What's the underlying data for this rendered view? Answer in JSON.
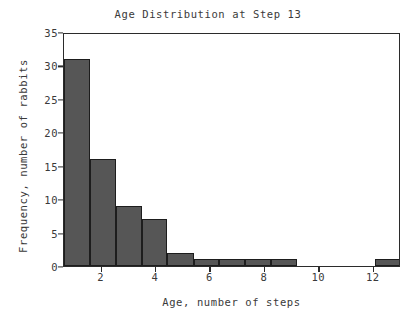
{
  "chart_data": {
    "type": "bar",
    "title": "Age Distribution at Step 13",
    "xlabel": "Age, number of steps",
    "ylabel": "Frequency, number of rabbits",
    "grid": false,
    "legend": false,
    "bar_color": "#565656",
    "bar_edge_color": "#1d1d1d",
    "xlim": [
      0.62,
      13.0
    ],
    "ylim": [
      0,
      35
    ],
    "xticks": [
      2,
      4,
      6,
      8,
      10,
      12
    ],
    "xticklabels": [
      "2",
      "4",
      "6",
      "8",
      "10",
      "12"
    ],
    "yticks": [
      0,
      5,
      10,
      15,
      20,
      25,
      30,
      35
    ],
    "yticklabels": [
      "0",
      "5",
      "10",
      "15",
      "20",
      "25",
      "30",
      "35"
    ],
    "bin_edges": [
      0.62,
      1.57,
      2.52,
      3.47,
      4.42,
      5.38,
      6.33,
      7.28,
      8.23,
      9.18,
      10.13,
      11.09,
      12.04,
      13.0
    ],
    "categories": [
      "0.6-1.6",
      "1.6-2.5",
      "2.5-3.5",
      "3.5-4.4",
      "4.4-5.4",
      "5.4-6.3",
      "6.3-7.3",
      "7.3-8.2",
      "8.2-9.2",
      "9.2-10.1",
      "10.1-11.1",
      "11.1-12.0",
      "12.0-13.0"
    ],
    "values": [
      31,
      16,
      9,
      7,
      2,
      1,
      1,
      1,
      1,
      0,
      0,
      0,
      1
    ]
  }
}
